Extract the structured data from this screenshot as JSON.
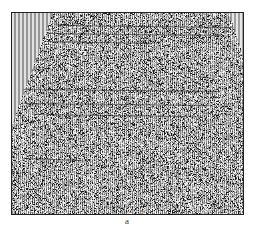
{
  "figure": {
    "caption": "a",
    "colors": {
      "background": "#ffffff",
      "frame": "#222222",
      "mute_stripe_light": "#e6e6e6",
      "mute_stripe_dark": "#8c8c8c",
      "reflector": "#1a1a1a"
    },
    "mute_zones": [
      {
        "side": "left",
        "top_width_px": 40,
        "bottom_y_fraction": 0.55
      },
      {
        "side": "right",
        "top_width_px": 14,
        "bottom_y_fraction": 0.22
      }
    ],
    "reflectors": [
      {
        "y_fraction": 0.06,
        "x_start": 0.2,
        "x_end": 0.95
      },
      {
        "y_fraction": 0.1,
        "x_start": 0.15,
        "x_end": 0.9
      },
      {
        "y_fraction": 0.14,
        "x_start": 0.15,
        "x_end": 0.6
      },
      {
        "y_fraction": 0.38,
        "x_start": 0.05,
        "x_end": 0.9
      },
      {
        "y_fraction": 0.45,
        "x_start": 0.05,
        "x_end": 0.85
      },
      {
        "y_fraction": 0.5,
        "x_start": 0.1,
        "x_end": 0.75
      },
      {
        "y_fraction": 0.72,
        "x_start": 0.05,
        "x_end": 0.3
      }
    ]
  }
}
